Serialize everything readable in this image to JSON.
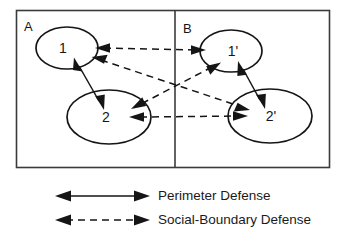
{
  "figure": {
    "background_color": "#ffffff",
    "line_color": "#151515",
    "frame_color": "#3b3b3b"
  },
  "panels": [
    {
      "id": "A",
      "label": "A"
    },
    {
      "id": "B",
      "label": "B"
    }
  ],
  "nodes": [
    {
      "id": "n1",
      "label": "1",
      "panel": "A",
      "cx": 67,
      "cy": 48,
      "rx": 31,
      "ry": 21
    },
    {
      "id": "n2",
      "label": "2",
      "panel": "A",
      "cx": 109,
      "cy": 117,
      "rx": 42,
      "ry": 27
    },
    {
      "id": "n1p",
      "label": "1'",
      "panel": "B",
      "cx": 231,
      "cy": 51,
      "rx": 31,
      "ry": 21
    },
    {
      "id": "n2p",
      "label": "2'",
      "panel": "B",
      "cx": 270,
      "cy": 116,
      "rx": 42,
      "ry": 27
    }
  ],
  "edges": [
    {
      "from": "n1",
      "to": "n2",
      "style": "solid",
      "defense": "Perimeter Defense",
      "bidirectional": true
    },
    {
      "from": "n1p",
      "to": "n2p",
      "style": "solid",
      "defense": "Perimeter Defense",
      "bidirectional": true
    },
    {
      "from": "n1",
      "to": "n1p",
      "style": "dashed",
      "defense": "Social-Boundary Defense",
      "bidirectional": true
    },
    {
      "from": "n2",
      "to": "n2p",
      "style": "dashed",
      "defense": "Social-Boundary Defense",
      "bidirectional": true
    },
    {
      "from": "n1",
      "to": "n2p",
      "style": "dashed",
      "defense": "Social-Boundary Defense",
      "bidirectional": true
    },
    {
      "from": "n1p",
      "to": "n2",
      "style": "dashed",
      "defense": "Social-Boundary Defense",
      "bidirectional": true
    }
  ],
  "legend": {
    "items": [
      {
        "style": "solid",
        "label": "Perimeter Defense"
      },
      {
        "style": "dashed",
        "label": "Social-Boundary Defense"
      }
    ]
  }
}
